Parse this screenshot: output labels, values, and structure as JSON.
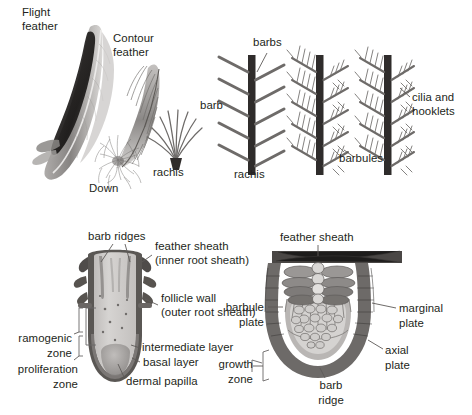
{
  "figure": {
    "title_visible": false,
    "background": "#ffffff",
    "ink": "#231f20"
  },
  "panels": {
    "feather_photos": {
      "name": "feather-photographs",
      "labels": {
        "flight_feather_line1": "Flight",
        "flight_feather_line2": "feather",
        "contour_feather_line1": "Contour",
        "contour_feather_line2": "feather",
        "down": "Down"
      }
    },
    "down_schematic": {
      "name": "down-feather-schematic",
      "labels": {
        "rachis": "rachis"
      }
    },
    "barb_schematic_1": {
      "name": "barb-rachis-schematic",
      "labels": {
        "barb": "barb",
        "barbs": "barbs",
        "rachis": "rachis"
      }
    },
    "barb_schematic_2": {
      "name": "barbule-schematic",
      "labels": {
        "barbules": "barbules"
      }
    },
    "barb_schematic_3": {
      "name": "cilia-hooklet-schematic",
      "labels": {
        "cilia_and_hooklets_line1": "cilia and",
        "cilia_and_hooklets_line2": "hooklets"
      }
    },
    "follicle_longitudinal": {
      "name": "feather-follicle-longitudinal-section",
      "labels": {
        "barb_ridges": "barb ridges",
        "feather_sheath": "feather sheath",
        "inner_root_sheath": "(inner root sheath)",
        "follicle_wall": "follicle wall",
        "outer_root_sheath": "(outer root sheath)",
        "intermediate_layer": "intermediate layer",
        "basal_layer": "basal layer",
        "dermal_papilla": "dermal papilla",
        "ramogenic_zone_line1": "ramogenic",
        "ramogenic_zone_line2": "zone",
        "proliferation_zone_line1": "proliferation",
        "proliferation_zone_line2": "zone"
      }
    },
    "follicle_cross_section": {
      "name": "feather-follicle-cross-section",
      "labels": {
        "feather_sheath": "feather sheath",
        "barbule_plate_line1": "barbule",
        "barbule_plate_line2": "plate",
        "marginal_plate_line1": "marginal",
        "marginal_plate_line2": "plate",
        "axial_plate_line1": "axial",
        "axial_plate_line2": "plate",
        "growth_zone_line1": "growth",
        "growth_zone_line2": "zone",
        "barb_ridge_line1": "barb",
        "barb_ridge_line2": "ridge"
      }
    }
  },
  "colors": {
    "ink": "#231f20",
    "leader": "#5d5a58",
    "rachis_dark": "#2f2c2b",
    "barb_gray": "#6e6b69",
    "sheath_dark": "#4a4745",
    "follicle_fill": "#cfcdcb",
    "pulp_fill": "#bdbab8",
    "plate_dark": "#8d8a88",
    "plate_light": "#b9b6b4",
    "papilla": "#a9a6a4",
    "white": "#ffffff"
  }
}
